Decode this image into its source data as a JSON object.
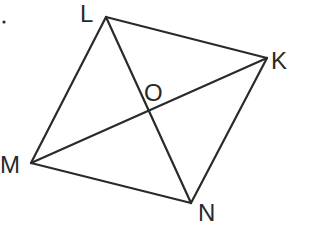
{
  "diagram": {
    "type": "quadrilateral-with-diagonals",
    "stroke_color": "#2a2a2a",
    "background": "#ffffff",
    "vertices": {
      "L": {
        "label": "L",
        "x": 106,
        "y": 17
      },
      "K": {
        "label": "K",
        "x": 267,
        "y": 58
      },
      "N": {
        "label": "N",
        "x": 191,
        "y": 203
      },
      "M": {
        "label": "M",
        "x": 31,
        "y": 163
      }
    },
    "intersection": {
      "label": "O",
      "x": 149,
      "y": 110
    },
    "sides": [
      "LK",
      "KN",
      "NM",
      "ML"
    ],
    "diagonals": [
      "LN",
      "MK"
    ],
    "labels": {
      "L": "L",
      "K": "K",
      "M": "M",
      "N": "N",
      "O": "O"
    },
    "stray_mark": "dot"
  }
}
